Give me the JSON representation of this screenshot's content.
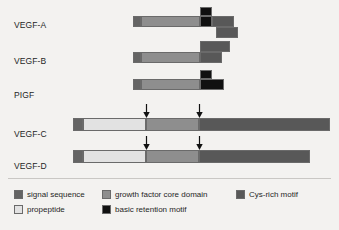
{
  "figure": {
    "background_color": "#f3f2f0"
  },
  "colors": {
    "signal_sequence": "#646464",
    "growth_factor_core_domain": "#8e8e8e",
    "cys_rich_motif": "#585858",
    "propeptide": "#e2e2e2",
    "basic_retention_motif": "#101010",
    "outline": "#6a6a6a",
    "arrow": "#111111",
    "text": "#1f1f1f"
  },
  "rows": [
    {
      "label": "VEGF-A",
      "label_x": 14,
      "label_y": 20,
      "segments": [
        {
          "name": "signal-sequence",
          "type": "signal_sequence",
          "x": 133,
          "y": 16,
          "w": 8,
          "h": 11
        },
        {
          "name": "growth-factor-core-domain",
          "type": "growth_factor_core_domain",
          "x": 141,
          "y": 16,
          "w": 59,
          "h": 11
        },
        {
          "name": "basic-retention-motif-top",
          "type": "basic_retention_motif",
          "x": 200,
          "y": 7,
          "w": 12,
          "h": 9
        },
        {
          "name": "basic-retention-motif",
          "type": "basic_retention_motif",
          "x": 200,
          "y": 16,
          "w": 12,
          "h": 11
        },
        {
          "name": "cys-rich-motif-upper",
          "type": "cys_rich_motif",
          "x": 212,
          "y": 16,
          "w": 22,
          "h": 11
        },
        {
          "name": "cys-rich-motif-lower",
          "type": "cys_rich_motif",
          "x": 216,
          "y": 27,
          "w": 22,
          "h": 11
        }
      ],
      "arrows": []
    },
    {
      "label": "VEGF-B",
      "label_x": 14,
      "label_y": 56,
      "segments": [
        {
          "name": "signal-sequence",
          "type": "signal_sequence",
          "x": 133,
          "y": 52,
          "w": 8,
          "h": 11
        },
        {
          "name": "growth-factor-core-domain",
          "type": "growth_factor_core_domain",
          "x": 141,
          "y": 52,
          "w": 59,
          "h": 11
        },
        {
          "name": "cys-rich-motif-isoform",
          "type": "cys_rich_motif",
          "x": 200,
          "y": 41,
          "w": 30,
          "h": 11
        },
        {
          "name": "cys-rich-motif",
          "type": "cys_rich_motif",
          "x": 200,
          "y": 52,
          "w": 22,
          "h": 11
        }
      ],
      "arrows": []
    },
    {
      "label": "PIGF",
      "label_x": 14,
      "label_y": 90,
      "segments": [
        {
          "name": "signal-sequence",
          "type": "signal_sequence",
          "x": 133,
          "y": 79,
          "w": 8,
          "h": 11
        },
        {
          "name": "growth-factor-core-domain",
          "type": "growth_factor_core_domain",
          "x": 141,
          "y": 79,
          "w": 59,
          "h": 11
        },
        {
          "name": "basic-retention-motif-top",
          "type": "basic_retention_motif",
          "x": 200,
          "y": 70,
          "w": 12,
          "h": 9
        },
        {
          "name": "basic-retention-motif",
          "type": "basic_retention_motif",
          "x": 200,
          "y": 79,
          "w": 24,
          "h": 11
        }
      ],
      "arrows": []
    },
    {
      "label": "VEGF-C",
      "label_x": 14,
      "label_y": 129,
      "segments": [
        {
          "name": "signal-sequence",
          "type": "signal_sequence",
          "x": 73,
          "y": 118,
          "w": 10,
          "h": 13
        },
        {
          "name": "propeptide-n-terminal",
          "type": "propeptide",
          "x": 83,
          "y": 118,
          "w": 63,
          "h": 13
        },
        {
          "name": "growth-factor-core-domain",
          "type": "growth_factor_core_domain",
          "x": 146,
          "y": 118,
          "w": 53,
          "h": 13
        },
        {
          "name": "cys-rich-motif",
          "type": "cys_rich_motif",
          "x": 199,
          "y": 118,
          "w": 131,
          "h": 13
        }
      ],
      "arrows": [
        {
          "name": "cleavage-site-arrow-1",
          "x": 146,
          "y_top": 104,
          "height": 14
        },
        {
          "name": "cleavage-site-arrow-2",
          "x": 199,
          "y_top": 104,
          "height": 14
        }
      ]
    },
    {
      "label": "VEGF-D",
      "label_x": 14,
      "label_y": 161,
      "segments": [
        {
          "name": "signal-sequence",
          "type": "signal_sequence",
          "x": 73,
          "y": 150,
          "w": 10,
          "h": 13
        },
        {
          "name": "propeptide-n-terminal",
          "type": "propeptide",
          "x": 83,
          "y": 150,
          "w": 63,
          "h": 13
        },
        {
          "name": "growth-factor-core-domain",
          "type": "growth_factor_core_domain",
          "x": 146,
          "y": 150,
          "w": 53,
          "h": 13
        },
        {
          "name": "cys-rich-motif",
          "type": "cys_rich_motif",
          "x": 199,
          "y": 150,
          "w": 111,
          "h": 13
        }
      ],
      "arrows": [
        {
          "name": "cleavage-site-arrow-1",
          "x": 146,
          "y_top": 136,
          "height": 14
        },
        {
          "name": "cleavage-site-arrow-2",
          "x": 199,
          "y_top": 136,
          "height": 14
        }
      ]
    }
  ],
  "legend": {
    "items": [
      {
        "label": "signal sequence",
        "type": "signal_sequence",
        "x": 14,
        "y": 188
      },
      {
        "label": "growth factor core domain",
        "type": "growth_factor_core_domain",
        "x": 102,
        "y": 188
      },
      {
        "label": "Cys-rich motif",
        "type": "cys_rich_motif",
        "x": 236,
        "y": 188
      },
      {
        "label": "propeptide",
        "type": "propeptide",
        "x": 14,
        "y": 203
      },
      {
        "label": "basic retention motif",
        "type": "basic_retention_motif",
        "x": 102,
        "y": 203
      }
    ]
  }
}
